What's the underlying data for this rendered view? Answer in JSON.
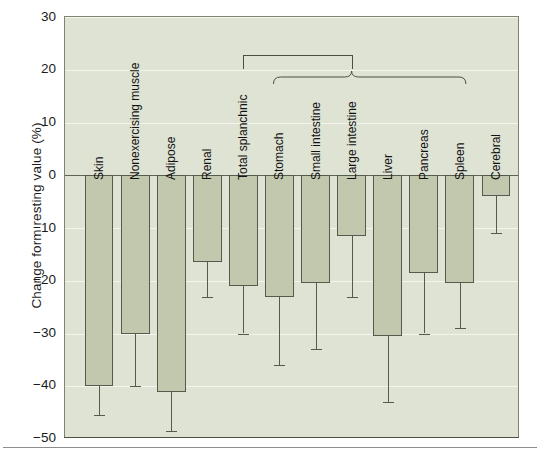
{
  "chart_data": {
    "type": "bar",
    "title": "",
    "xlabel": "",
    "ylabel": "Change form resting value (%)",
    "ylim": [
      -50,
      30
    ],
    "yticks": [
      30,
      20,
      10,
      0,
      -10,
      -20,
      -30,
      -40,
      -50
    ],
    "ytick_labels": [
      "30",
      "20",
      "10",
      "0",
      "−10",
      "−20",
      "−30",
      "−40",
      "−50"
    ],
    "grid": true,
    "legend": "none",
    "categories": [
      "Skin",
      "Nonexercising muscle",
      "Adipose",
      "Renal",
      "Total splanchnic",
      "Stomach",
      "Small intestine",
      "Large intestine",
      "Liver",
      "Pancreas",
      "Spleen",
      "Cerebral"
    ],
    "values": [
      -40,
      -30,
      -41,
      -16.5,
      -21,
      -23,
      -20.5,
      -11.5,
      -30.5,
      -18.5,
      -20.5,
      -4
    ],
    "error_low": [
      -45.5,
      -40,
      -48.5,
      -23,
      -30,
      -36,
      -33,
      -23,
      -43,
      -30,
      -29,
      -11
    ],
    "annotations": [
      {
        "name": "total-splanchnic-bracket",
        "type": "square-bracket",
        "spans": [
          "Total splanchnic",
          "Large intestine"
        ],
        "text": ""
      },
      {
        "name": "splanchnic-subgroup-brace",
        "type": "curly-brace",
        "spans": [
          "Stomach",
          "Spleen"
        ],
        "text": ""
      }
    ],
    "colors": {
      "bar_fill": "#c2c8ae",
      "bar_edge": "#555b4c",
      "plot_background": "#dfe3d4",
      "gridline": "#f4f6ee",
      "zero_line": "#5e6455",
      "text": "#121212"
    }
  }
}
